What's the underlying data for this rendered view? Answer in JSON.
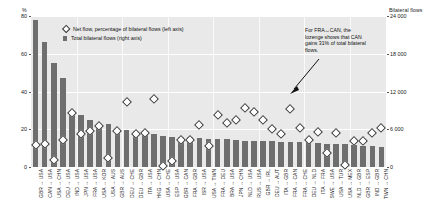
{
  "chart_data": {
    "type": "bar",
    "title": "",
    "left_axis": {
      "label": "%",
      "ticks": [
        "0",
        "20",
        "40",
        "60",
        "80"
      ],
      "min": 0,
      "max": 80
    },
    "right_axis": {
      "label": "Bilateral flows",
      "ticks": [
        "0",
        "6 000",
        "12 000",
        "18 000",
        "24 000"
      ],
      "min": 0,
      "max": 24000
    },
    "grid": true,
    "legend_position": "top-left",
    "legend": [
      {
        "marker": "lozenge",
        "label": "Net flow, percentage of bilateral flows (left axis)"
      },
      {
        "marker": "square",
        "label": "Total bilateral flows (right axis)"
      }
    ],
    "annotation": {
      "text": "For FRA↔CAN, the lozenge shows that CAN gains 31% of total bilateral flows.",
      "target_category": "FRA ↔ CAN"
    },
    "categories": [
      "GBR ↔ USA",
      "CAN ↔ USA",
      "USA ↔ CHN",
      "DEU ↔ USA",
      "IND ↔ USA",
      "JPN ↔ USA",
      "FRA ↔ USA",
      "USA ↔ KOR",
      "USA ↔ AUS",
      "GBR ↔ AUS",
      "DEU ↔ CHE",
      "DEU ↔ GBR",
      "ITA ↔ USA",
      "HKG ↔ CHN",
      "USA ↔ CHE",
      "ESP ↔ USA",
      "GBR ↔ CAN",
      "FRA ↔ GBR",
      "ISR ↔ USA",
      "USA ↔ TWN",
      "FRA ↔ DEU",
      "BRA ↔ USA",
      "JPN ↔ CHN",
      "NLD ↔ USA",
      "RUS ↔ USA",
      "GBR ↔ IRL",
      "DEU ↔ AUT",
      "ITA ↔ GBR",
      "FRA ↔ CAN",
      "FRA ↔ CHE",
      "DEU ↔ NLD",
      "ITA ↔ FRA",
      "SWE ↔ USA",
      "USA ↔ TUR",
      "USA ↔ MEX",
      "NLD ↔ GBR",
      "GBR ↔ ESP",
      "IND ↔ GBR",
      "TWN ↔ CHN"
    ],
    "series": [
      {
        "name": "Total bilateral flows (right axis)",
        "axis": "right",
        "unit": "flows",
        "values": [
          23300,
          19900,
          16500,
          14100,
          8900,
          8300,
          7500,
          6900,
          6800,
          6000,
          5900,
          5800,
          5700,
          5300,
          4900,
          4800,
          4700,
          4700,
          4600,
          4500,
          4400,
          4400,
          4300,
          4200,
          4200,
          4100,
          4100,
          4000,
          4000,
          3900,
          3900,
          3800,
          3700,
          3600,
          3600,
          3500,
          3400,
          3300,
          3200
        ]
      },
      {
        "name": "Net flow, percentage of bilateral flows (left axis)",
        "axis": "left",
        "unit": "%",
        "values": [
          12,
          12.5,
          4,
          14.5,
          29,
          17.5,
          19.5,
          22,
          5,
          19.5,
          34.5,
          17.5,
          18.5,
          36,
          1,
          3.5,
          14.5,
          14.5,
          22.5,
          11.5,
          28,
          23.5,
          25,
          31.5,
          29.5,
          25,
          20.5,
          17.5,
          31,
          21,
          14.5,
          19,
          7.5,
          18,
          1.5,
          14,
          14,
          18.5,
          21
        ]
      }
    ]
  }
}
